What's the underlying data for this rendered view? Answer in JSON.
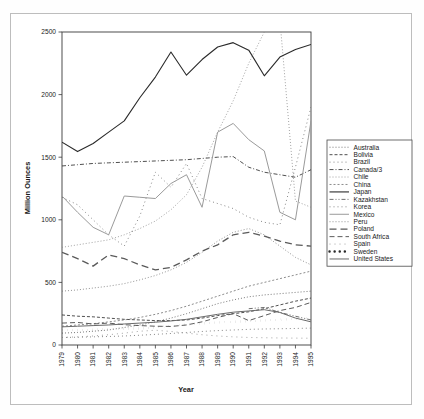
{
  "chart_data": {
    "type": "line",
    "title": "",
    "xlabel": "Year",
    "ylabel": "Million Ounces",
    "xlim": [
      1979,
      1995
    ],
    "ylim": [
      0,
      2500
    ],
    "yticks": [
      0,
      500,
      1000,
      1500,
      2000,
      2500
    ],
    "ytick_labels": [
      "0",
      "500",
      "1000",
      "1500",
      "2000",
      "2500"
    ],
    "grid": false,
    "legend_position": "right",
    "categories": [
      1979,
      1980,
      1981,
      1982,
      1983,
      1984,
      1985,
      1986,
      1987,
      1988,
      1989,
      1990,
      1991,
      1992,
      1993,
      1994,
      1995
    ],
    "xtick_labels": [
      "1979",
      "1980",
      "1981",
      "1982",
      "1983",
      "1984",
      "1985",
      "1986",
      "1987",
      "1988",
      "1989",
      "1990",
      "1991",
      "1992",
      "1993",
      "1994",
      "1995"
    ],
    "series": [
      {
        "name": "Australia",
        "dash": "1,2",
        "width": 0.8,
        "color": "#555555",
        "values": [
          95,
          100,
          110,
          120,
          140,
          160,
          185,
          215,
          250,
          290,
          330,
          360,
          385,
          400,
          410,
          420,
          430
        ]
      },
      {
        "name": "Bolivia",
        "dash": "3,2",
        "width": 0.9,
        "color": "#3c3c3c",
        "values": [
          240,
          230,
          225,
          215,
          205,
          200,
          195,
          195,
          200,
          215,
          235,
          250,
          265,
          290,
          320,
          350,
          375
        ]
      },
      {
        "name": "Brazil",
        "dash": "1,3",
        "width": 0.8,
        "color": "#6a6a6a",
        "values": [
          60,
          62,
          65,
          68,
          72,
          78,
          85,
          92,
          100,
          108,
          115,
          120,
          125,
          128,
          130,
          132,
          135
        ]
      },
      {
        "name": "Canada/3",
        "dash": "4,2,1,2",
        "width": 0.9,
        "color": "#3c3c3c",
        "values": [
          1430,
          1440,
          1450,
          1455,
          1460,
          1465,
          1470,
          1475,
          1480,
          1490,
          1500,
          1505,
          1420,
          1380,
          1360,
          1340,
          1400
        ]
      },
      {
        "name": "Chile",
        "dash": "1,2",
        "width": 0.8,
        "color": "#8a8a8a",
        "values": [
          780,
          800,
          820,
          840,
          880,
          930,
          990,
          1080,
          1200,
          1420,
          1700,
          1950,
          2250,
          2500,
          2600,
          1150,
          1100
        ]
      },
      {
        "name": "China",
        "dash": "2,2",
        "width": 0.8,
        "color": "#707070",
        "values": [
          150,
          160,
          170,
          185,
          200,
          220,
          245,
          275,
          310,
          350,
          390,
          430,
          470,
          500,
          530,
          560,
          590
        ]
      },
      {
        "name": "Japan",
        "dash": "none",
        "width": 1.1,
        "color": "#2a2a2a",
        "values": [
          1620,
          1545,
          1610,
          1700,
          1790,
          1975,
          2140,
          2340,
          2155,
          2280,
          2380,
          2415,
          2355,
          2150,
          2300,
          2360,
          2400
        ]
      },
      {
        "name": "Kazakhstan",
        "dash": "4,2,1,2,1,2",
        "width": 0.85,
        "color": "#555555",
        "values": [
          0,
          0,
          0,
          0,
          0,
          0,
          0,
          0,
          0,
          0,
          0,
          0,
          290,
          300,
          260,
          230,
          200
        ]
      },
      {
        "name": "Korea",
        "dash": "1,3",
        "width": 0.8,
        "color": "#6a6a6a",
        "values": [
          1180,
          1120,
          1000,
          880,
          790,
          1030,
          1380,
          1260,
          1450,
          1170,
          1130,
          1090,
          1020,
          980,
          960,
          1420,
          1900
        ]
      },
      {
        "name": "Mexico",
        "dash": "none",
        "width": 1.0,
        "color": "#9a9a9a",
        "values": [
          1190,
          1060,
          940,
          880,
          1190,
          1180,
          1170,
          1290,
          1360,
          1100,
          1700,
          1770,
          1640,
          1550,
          1060,
          1000,
          1790
        ]
      },
      {
        "name": "Peru",
        "dash": "1,2",
        "width": 0.8,
        "color": "#777777",
        "values": [
          430,
          440,
          455,
          470,
          490,
          520,
          555,
          600,
          660,
          740,
          830,
          900,
          930,
          880,
          790,
          700,
          640
        ]
      },
      {
        "name": "Poland",
        "dash": "7,4",
        "width": 1.3,
        "color": "#5a5a5a",
        "values": [
          740,
          690,
          630,
          720,
          690,
          640,
          600,
          620,
          680,
          750,
          800,
          880,
          900,
          870,
          830,
          800,
          790
        ]
      },
      {
        "name": "South Africa",
        "dash": "5,3",
        "width": 0.9,
        "color": "#4a4a4a",
        "values": [
          175,
          180,
          168,
          175,
          162,
          155,
          150,
          148,
          160,
          185,
          220,
          250,
          195,
          235,
          275,
          300,
          340
        ]
      },
      {
        "name": "Spain",
        "dash": "1,4",
        "width": 0.8,
        "color": "#8a8a8a",
        "values": [
          60,
          65,
          72,
          82,
          95,
          110,
          118,
          108,
          95,
          82,
          72,
          65,
          60,
          58,
          56,
          55,
          54
        ]
      },
      {
        "name": "Sweden",
        "dash": "0.1,5",
        "width": 2.4,
        "color": "#2a2a2a",
        "values": [
          120,
          118,
          122,
          128,
          130,
          132,
          140,
          152,
          165,
          172,
          180,
          185,
          190,
          196,
          202,
          208,
          215
        ]
      },
      {
        "name": "United States",
        "dash": "none",
        "width": 1.0,
        "color": "#6a6a6a",
        "values": [
          145,
          150,
          155,
          160,
          168,
          175,
          182,
          192,
          205,
          225,
          245,
          262,
          272,
          282,
          260,
          215,
          185
        ]
      }
    ],
    "legend_entries": [
      "Australia",
      "Bolivia",
      "Brazil",
      "Canada/3",
      "Chile",
      "China",
      "Japan",
      "Kazakhstan",
      "Korea",
      "Mexico",
      "Peru",
      "Poland",
      "South Africa",
      "Spain",
      "Sweden",
      "United States"
    ]
  },
  "geometry": {
    "plot_left": 62,
    "plot_right": 311,
    "plot_top": 32,
    "plot_bottom": 345,
    "legend_left": 327,
    "legend_top": 140,
    "legend_right": 412,
    "legend_bottom": 260
  }
}
